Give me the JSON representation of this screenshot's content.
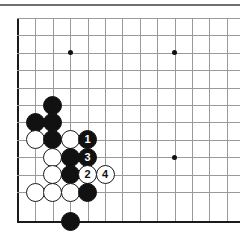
{
  "figure": {
    "board_size_cols": 13,
    "board_size_rows": 12,
    "geometry": {
      "origin_x": 18,
      "origin_y": 18,
      "spacing": 17.4,
      "bottom_edge_y": 221,
      "stone_diameter": 19
    },
    "colors": {
      "background": "#ffffff",
      "grid": "#9a9a9a",
      "edge": "#1a1a1a",
      "black_stone": "#111111",
      "white_stone": "#ffffff",
      "rule": "#6f6f6f"
    }
  },
  "star_points": [
    {
      "name": "star-point-left",
      "col": 3,
      "row": 2
    },
    {
      "name": "star-point-right",
      "col": 9,
      "row": 2
    },
    {
      "name": "star-point-lower-right",
      "col": 9,
      "row": 8
    }
  ],
  "stones": [
    {
      "id": "b-c2r5",
      "color": "black",
      "col": 2,
      "row": 5,
      "label": ""
    },
    {
      "id": "b-c1r6",
      "color": "black",
      "col": 1,
      "row": 6,
      "label": ""
    },
    {
      "id": "b-c2r6",
      "color": "black",
      "col": 2,
      "row": 6,
      "label": ""
    },
    {
      "id": "w-c1r7",
      "color": "white",
      "col": 1,
      "row": 7,
      "label": ""
    },
    {
      "id": "b-c2r7",
      "color": "black",
      "col": 2,
      "row": 7,
      "label": ""
    },
    {
      "id": "w-c3r7",
      "color": "white",
      "col": 3,
      "row": 7,
      "label": ""
    },
    {
      "id": "b-c4r7",
      "color": "black",
      "col": 4,
      "row": 7,
      "label": "1"
    },
    {
      "id": "w-c2r8",
      "color": "white",
      "col": 2,
      "row": 8,
      "label": ""
    },
    {
      "id": "b-c3r8",
      "color": "black",
      "col": 3,
      "row": 8,
      "label": ""
    },
    {
      "id": "b-c4r8",
      "color": "black",
      "col": 4,
      "row": 8,
      "label": "3"
    },
    {
      "id": "w-c2r9",
      "color": "white",
      "col": 2,
      "row": 9,
      "label": ""
    },
    {
      "id": "b-c3r9",
      "color": "black",
      "col": 3,
      "row": 9,
      "label": ""
    },
    {
      "id": "w-c4r9",
      "color": "white",
      "col": 4,
      "row": 9,
      "label": "2"
    },
    {
      "id": "w-c5r9",
      "color": "white",
      "col": 5,
      "row": 9,
      "label": "4"
    },
    {
      "id": "w-c1r10",
      "color": "white",
      "col": 1,
      "row": 10,
      "label": ""
    },
    {
      "id": "w-c2r10",
      "color": "white",
      "col": 2,
      "row": 10,
      "label": ""
    },
    {
      "id": "w-c3r10",
      "color": "white",
      "col": 3,
      "row": 10,
      "label": ""
    },
    {
      "id": "b-c4r10",
      "color": "black",
      "col": 4,
      "row": 10,
      "label": ""
    },
    {
      "id": "b-c3r11",
      "color": "black",
      "col": 3,
      "row": 11,
      "label": ""
    }
  ],
  "move_sequence": [
    {
      "number": "1",
      "color": "black"
    },
    {
      "number": "2",
      "color": "white"
    },
    {
      "number": "3",
      "color": "black"
    },
    {
      "number": "4",
      "color": "white"
    }
  ]
}
